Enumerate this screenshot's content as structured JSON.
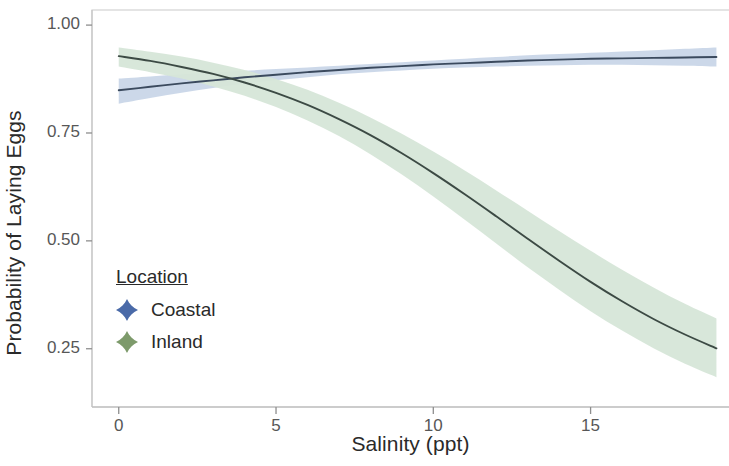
{
  "chart_data": {
    "type": "line",
    "title": "",
    "xlabel": "Salinity (ppt)",
    "ylabel": "Probability of Laying Eggs",
    "xlim": [
      -0.85,
      19.4
    ],
    "ylim": [
      0.115,
      1.035
    ],
    "xticks": [
      0,
      5,
      10,
      15
    ],
    "xtick_labels": [
      "0",
      "5",
      "10",
      "15"
    ],
    "yticks": [
      0.25,
      0.5,
      0.75,
      1.0
    ],
    "ytick_labels": [
      "0.25",
      "0.50",
      "0.75",
      "1.00"
    ],
    "grid": false,
    "legend_position": "inside-lower-left",
    "legend_title": "Location",
    "x": [
      0,
      1,
      2,
      3,
      4,
      5,
      6,
      7,
      8,
      9,
      10,
      11,
      12,
      13,
      14,
      15,
      16,
      17,
      18,
      19
    ],
    "series": [
      {
        "name": "Coastal",
        "line_color": "#3b4a5e",
        "ribbon_color": "#c9d6e8",
        "key_color": "#4a6aa8",
        "values": [
          0.849,
          0.857,
          0.865,
          0.872,
          0.879,
          0.885,
          0.891,
          0.896,
          0.901,
          0.905,
          0.909,
          0.912,
          0.915,
          0.918,
          0.92,
          0.922,
          0.923,
          0.924,
          0.925,
          0.926
        ],
        "ci_lower": [
          0.818,
          0.831,
          0.843,
          0.854,
          0.864,
          0.872,
          0.879,
          0.886,
          0.891,
          0.895,
          0.899,
          0.902,
          0.904,
          0.906,
          0.907,
          0.908,
          0.908,
          0.907,
          0.906,
          0.904
        ],
        "ci_upper": [
          0.876,
          0.881,
          0.886,
          0.89,
          0.894,
          0.898,
          0.902,
          0.906,
          0.91,
          0.914,
          0.918,
          0.922,
          0.926,
          0.93,
          0.933,
          0.936,
          0.939,
          0.942,
          0.945,
          0.948
        ]
      },
      {
        "name": "Inland",
        "line_color": "#3c4a44",
        "ribbon_color": "#d6e6d8",
        "key_color": "#7d9a6b",
        "values": [
          0.928,
          0.917,
          0.903,
          0.887,
          0.867,
          0.843,
          0.815,
          0.782,
          0.745,
          0.703,
          0.657,
          0.608,
          0.557,
          0.505,
          0.454,
          0.405,
          0.36,
          0.319,
          0.283,
          0.251
        ],
        "ci_lower": [
          0.904,
          0.891,
          0.876,
          0.858,
          0.836,
          0.81,
          0.779,
          0.743,
          0.701,
          0.654,
          0.603,
          0.549,
          0.494,
          0.439,
          0.387,
          0.337,
          0.292,
          0.251,
          0.215,
          0.184
        ],
        "ci_upper": [
          0.948,
          0.938,
          0.927,
          0.913,
          0.896,
          0.875,
          0.85,
          0.82,
          0.786,
          0.748,
          0.707,
          0.663,
          0.617,
          0.57,
          0.523,
          0.477,
          0.433,
          0.392,
          0.354,
          0.32
        ]
      }
    ],
    "annotations": []
  },
  "axes": {
    "y_title": "Probability of Laying Eggs",
    "x_title": "Salinity (ppt)",
    "y_tick_labels": [
      "1.00",
      "0.75",
      "0.50",
      "0.25"
    ],
    "x_tick_labels": [
      "0",
      "5",
      "10",
      "15"
    ]
  },
  "legend": {
    "title": "Location",
    "items": [
      {
        "label": "Coastal",
        "color": "#4a6aa8",
        "key": "diamond-marker"
      },
      {
        "label": "Inland",
        "color": "#7d9a6b",
        "key": "diamond-marker"
      }
    ]
  }
}
